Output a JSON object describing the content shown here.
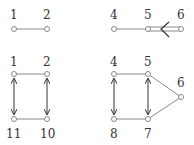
{
  "diagram": {
    "panels": [
      {
        "id": "top-left",
        "nodes": [
          {
            "label": "1",
            "x": 14,
            "y": 29
          },
          {
            "label": "2",
            "x": 47,
            "y": 29
          }
        ]
      },
      {
        "id": "top-right",
        "nodes": [
          {
            "label": "4",
            "x": 114,
            "y": 29
          },
          {
            "label": "5",
            "x": 148,
            "y": 29
          },
          {
            "label": "6",
            "x": 181,
            "y": 29
          }
        ]
      },
      {
        "id": "bottom-left",
        "nodes": [
          {
            "label": "1",
            "x": 14,
            "y": 74
          },
          {
            "label": "2",
            "x": 47,
            "y": 74
          },
          {
            "label": "11",
            "x": 14,
            "y": 119
          },
          {
            "label": "10",
            "x": 47,
            "y": 119
          }
        ]
      },
      {
        "id": "bottom-right",
        "nodes": [
          {
            "label": "4",
            "x": 114,
            "y": 74
          },
          {
            "label": "5",
            "x": 148,
            "y": 74
          },
          {
            "label": "6",
            "x": 181,
            "y": 97
          },
          {
            "label": "8",
            "x": 114,
            "y": 119
          },
          {
            "label": "7",
            "x": 148,
            "y": 119
          }
        ]
      }
    ],
    "labels": {
      "n1a": "1",
      "n2a": "2",
      "n4a": "4",
      "n5a": "5",
      "n6a": "6",
      "n1b": "1",
      "n2b": "2",
      "n11": "11",
      "n10": "10",
      "n4b": "4",
      "n5b": "5",
      "n6b": "6",
      "n8": "8",
      "n7": "7"
    },
    "colors": {
      "edge": "#888888",
      "arrow": "#333333",
      "node_fill": "#ffffff"
    }
  }
}
